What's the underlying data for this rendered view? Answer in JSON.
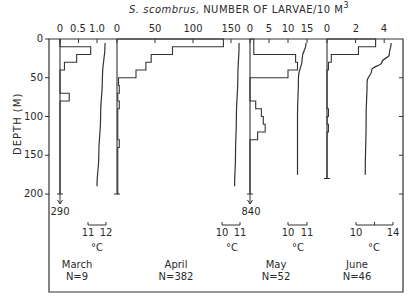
{
  "chart_data": {
    "type": "depth-profile-histogram",
    "title": "S. scombrus, NUMBER OF LARVAE/10 M3",
    "title_species": "S. scombrus",
    "title_rest": ", NUMBER OF LARVAE/10 M",
    "title_sup": "3",
    "ylabel": "DEPTH (M)",
    "yticks": [
      "0",
      "50",
      "100",
      "150",
      "200"
    ],
    "ylim": [
      0,
      200
    ],
    "y_inverted": true,
    "panels": [
      {
        "month": "March",
        "n_label": "N=9",
        "xticks": [
          "0",
          "0.5",
          "1.0"
        ],
        "xlim": [
          0,
          1.2
        ],
        "larvae_histogram": [
          {
            "depth_top": 0,
            "depth_bottom": 10,
            "value": 0
          },
          {
            "depth_top": 10,
            "depth_bottom": 20,
            "value": 0.83
          },
          {
            "depth_top": 20,
            "depth_bottom": 30,
            "value": 0.45
          },
          {
            "depth_top": 30,
            "depth_bottom": 40,
            "value": 0.12
          },
          {
            "depth_top": 40,
            "depth_bottom": 70,
            "value": 0
          },
          {
            "depth_top": 70,
            "depth_bottom": 80,
            "value": 0.25
          },
          {
            "depth_top": 80,
            "depth_bottom": 200,
            "value": 0
          }
        ],
        "off_scale_arrow": {
          "depth": 200,
          "label": "290"
        },
        "temperature_scale": {
          "ticks": [
            "11",
            "12"
          ],
          "unit": "°C"
        },
        "temperature_profile": [
          {
            "depth": 5,
            "temp": 11.95
          },
          {
            "depth": 50,
            "temp": 11.8
          },
          {
            "depth": 100,
            "temp": 11.7
          },
          {
            "depth": 150,
            "temp": 11.6
          },
          {
            "depth": 190,
            "temp": 11.5
          }
        ]
      },
      {
        "month": "April",
        "n_label": "N=382",
        "xticks": [
          "0",
          "50",
          "100",
          "150"
        ],
        "xlim": [
          0,
          175
        ],
        "larvae_histogram": [
          {
            "depth_top": 0,
            "depth_bottom": 10,
            "value": 140
          },
          {
            "depth_top": 10,
            "depth_bottom": 20,
            "value": 73
          },
          {
            "depth_top": 20,
            "depth_bottom": 30,
            "value": 45
          },
          {
            "depth_top": 30,
            "depth_bottom": 40,
            "value": 38
          },
          {
            "depth_top": 40,
            "depth_bottom": 50,
            "value": 25
          },
          {
            "depth_top": 50,
            "depth_bottom": 60,
            "value": 2
          },
          {
            "depth_top": 60,
            "depth_bottom": 70,
            "value": 3
          },
          {
            "depth_top": 70,
            "depth_bottom": 80,
            "value": 1
          },
          {
            "depth_top": 80,
            "depth_bottom": 90,
            "value": 3
          },
          {
            "depth_top": 90,
            "depth_bottom": 130,
            "value": 1
          },
          {
            "depth_top": 130,
            "depth_bottom": 140,
            "value": 3
          },
          {
            "depth_top": 140,
            "depth_bottom": 200,
            "value": 1
          }
        ],
        "temperature_scale": {
          "ticks": [
            "10",
            "11"
          ],
          "unit": "°C"
        },
        "temperature_profile": [
          {
            "depth": 5,
            "temp": 10.95
          },
          {
            "depth": 50,
            "temp": 10.88
          },
          {
            "depth": 100,
            "temp": 10.8
          },
          {
            "depth": 150,
            "temp": 10.75
          },
          {
            "depth": 190,
            "temp": 10.7
          }
        ]
      },
      {
        "month": "May",
        "n_label": "N=52",
        "xticks": [
          "0",
          "5",
          "10",
          "15"
        ],
        "xlim": [
          0,
          20
        ],
        "larvae_histogram": [
          {
            "depth_top": 0,
            "depth_bottom": 10,
            "value": 1
          },
          {
            "depth_top": 10,
            "depth_bottom": 20,
            "value": 1
          },
          {
            "depth_top": 20,
            "depth_bottom": 30,
            "value": 12
          },
          {
            "depth_top": 30,
            "depth_bottom": 40,
            "value": 12.5
          },
          {
            "depth_top": 40,
            "depth_bottom": 50,
            "value": 10
          },
          {
            "depth_top": 50,
            "depth_bottom": 80,
            "value": 0
          },
          {
            "depth_top": 80,
            "depth_bottom": 90,
            "value": 1.5
          },
          {
            "depth_top": 90,
            "depth_bottom": 100,
            "value": 3
          },
          {
            "depth_top": 100,
            "depth_bottom": 110,
            "value": 3.5
          },
          {
            "depth_top": 110,
            "depth_bottom": 120,
            "value": 4
          },
          {
            "depth_top": 120,
            "depth_bottom": 130,
            "value": 2
          },
          {
            "depth_top": 130,
            "depth_bottom": 200,
            "value": 0
          }
        ],
        "off_scale_arrow": {
          "depth": 200,
          "label": "840"
        },
        "temperature_scale": {
          "ticks": [
            "10",
            "11"
          ],
          "unit": "°C"
        },
        "temperature_profile": [
          {
            "depth": 5,
            "temp": 10.95
          },
          {
            "depth": 25,
            "temp": 10.75
          },
          {
            "depth": 50,
            "temp": 10.55
          },
          {
            "depth": 100,
            "temp": 10.5
          },
          {
            "depth": 150,
            "temp": 10.5
          },
          {
            "depth": 175,
            "temp": 10.5
          }
        ]
      },
      {
        "month": "June",
        "n_label": "N=46",
        "xticks": [
          "0",
          "2",
          "4"
        ],
        "xlim": [
          0,
          5
        ],
        "larvae_histogram": [
          {
            "depth_top": 0,
            "depth_bottom": 10,
            "value": 3.4
          },
          {
            "depth_top": 10,
            "depth_bottom": 20,
            "value": 2.2
          },
          {
            "depth_top": 20,
            "depth_bottom": 30,
            "value": 0.3
          },
          {
            "depth_top": 30,
            "depth_bottom": 40,
            "value": 0.1
          },
          {
            "depth_top": 40,
            "depth_bottom": 90,
            "value": 0
          },
          {
            "depth_top": 90,
            "depth_bottom": 100,
            "value": 0.1
          },
          {
            "depth_top": 100,
            "depth_bottom": 110,
            "value": 0
          },
          {
            "depth_top": 110,
            "depth_bottom": 120,
            "value": 0.1
          },
          {
            "depth_top": 120,
            "depth_bottom": 180,
            "value": 0
          }
        ],
        "temperature_scale": {
          "ticks": [
            "10",
            "14"
          ],
          "unit": "°C"
        },
        "temperature_profile": [
          {
            "depth": 5,
            "temp": 13.8
          },
          {
            "depth": 20,
            "temp": 13.6
          },
          {
            "depth": 30,
            "temp": 12.8
          },
          {
            "depth": 40,
            "temp": 11.7
          },
          {
            "depth": 55,
            "temp": 11.2
          },
          {
            "depth": 100,
            "temp": 11.1
          },
          {
            "depth": 175,
            "temp": 11.0
          }
        ]
      }
    ],
    "grid": false,
    "legend": "none"
  }
}
